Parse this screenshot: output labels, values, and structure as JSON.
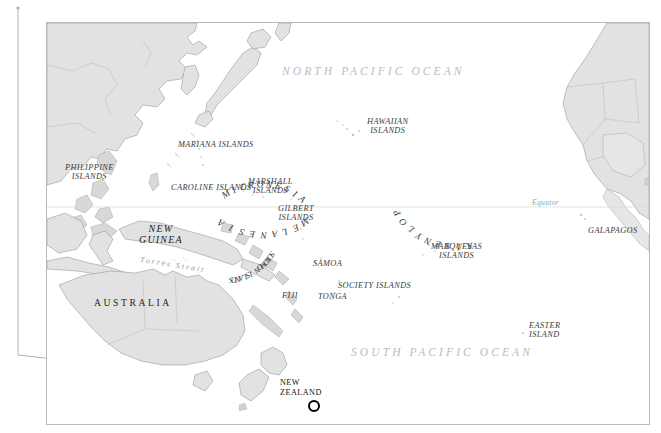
{
  "map": {
    "title": "Pacific Ocean reference map",
    "frame": {
      "x": 46,
      "y": 22,
      "width": 604,
      "height": 403
    },
    "background_color": "#ffffff",
    "land_fill": "#e2e2e2",
    "land_stroke": "#9b9b9b",
    "ocean_label_color": "#b6bcc4",
    "label_color": "#3b3b3b",
    "graticule_color": "#cfd4d9"
  },
  "oceans": [
    {
      "name": "north-pacific",
      "text": "NORTH PACIFIC OCEAN",
      "x": 281,
      "y": 64
    },
    {
      "name": "south-pacific",
      "text": "SOUTH PACIFIC OCEAN",
      "x": 350,
      "y": 345
    }
  ],
  "equator": {
    "label": "Equator",
    "x": 531,
    "y": 198,
    "line_y": 206
  },
  "regions": [
    {
      "name": "mariana-islands",
      "text": "MARIANA ISLANDS",
      "x": 177,
      "y": 139
    },
    {
      "name": "caroline-islands",
      "text": "CAROLINE ISLANDS",
      "x": 170,
      "y": 182
    },
    {
      "name": "marshall-islands",
      "text": "MARSHALL\nISLANDS",
      "x": 247,
      "y": 176
    },
    {
      "name": "gilbert-islands",
      "text": "GILBERT\nISLANDS",
      "x": 277,
      "y": 203
    },
    {
      "name": "hawaiian-islands",
      "text": "HAWAIIAN\nISLANDS",
      "x": 366,
      "y": 116
    },
    {
      "name": "marquesas-islands",
      "text": "MARQUESAS\nISLANDS",
      "x": 430,
      "y": 241
    },
    {
      "name": "society-islands",
      "text": "SOCIETY ISLANDS",
      "x": 337,
      "y": 280
    },
    {
      "name": "samoa",
      "text": "SAMOA",
      "x": 312,
      "y": 258
    },
    {
      "name": "fiji",
      "text": "FIJI",
      "x": 281,
      "y": 290
    },
    {
      "name": "tonga",
      "text": "TONGA",
      "x": 317,
      "y": 291
    },
    {
      "name": "easter-island",
      "text": "EASTER\nISLAND",
      "x": 528,
      "y": 320
    },
    {
      "name": "galapagos",
      "text": "GALAPAGOS",
      "x": 587,
      "y": 225
    },
    {
      "name": "philippine-islands",
      "text": "PHILIPPINE\nISLANDS",
      "x": 64,
      "y": 162
    },
    {
      "name": "new-guinea",
      "text": "NEW\nGUINEA",
      "x": 138,
      "y": 222
    },
    {
      "name": "torres-strait",
      "text": "Torres Strait",
      "x": 139,
      "y": 255
    }
  ],
  "arc_labels": [
    {
      "name": "micronesia",
      "text": "MICRONESIA",
      "cx": 214,
      "cy": 225,
      "radius": 64,
      "start_deg": -123,
      "step_deg": 8.1
    },
    {
      "name": "melanesia",
      "text": "MELANESIA",
      "cx": 216,
      "cy": 136,
      "radius": 76,
      "start_deg": 56,
      "step_deg": 8.4
    },
    {
      "name": "polynesia",
      "text": "POLYNESIA",
      "cx": 411,
      "cy": 152,
      "radius": 72,
      "start_deg": 148,
      "step_deg": -8.4
    },
    {
      "name": "solomon-islands",
      "text": "SOLOMON ISLANDS",
      "cx": 176,
      "cy": 200,
      "radius": 58,
      "start_deg": 32,
      "step_deg": 3.6,
      "size": 8
    }
  ],
  "countries": [
    {
      "name": "australia",
      "text": "AUSTRALIA",
      "x": 93,
      "y": 301
    }
  ],
  "marker": {
    "name": "new-zealand-marker",
    "label": "NEW\nZEALAND",
    "label_x": 279,
    "label_y": 377,
    "cx": 267,
    "cy": 383
  },
  "leader_line": {
    "name": "callout-leader-line",
    "color": "#b0b0b0",
    "points": "18,8 18,355 267,383"
  }
}
